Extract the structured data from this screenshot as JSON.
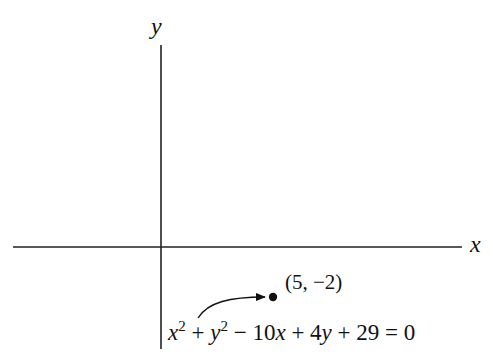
{
  "diagram": {
    "axes": {
      "x_label": "x",
      "y_label": "y",
      "origin_px": [
        161,
        247
      ]
    },
    "point": {
      "label": "(5, −2)",
      "coords": [
        5,
        -2
      ]
    },
    "equation": {
      "x_term": "x",
      "x_exp": "2",
      "plus1": " + ",
      "y_term": "y",
      "y_exp": "2",
      "rest_minus": " − 10",
      "rest_x": "x",
      "rest_plus": " + 4",
      "rest_y": "y",
      "rest_tail": " + 29 = 0",
      "full": "x² + y² − 10x + 4y + 29 = 0"
    },
    "annotation": {
      "arrow": "curved arrow from equation to point"
    },
    "colors": {
      "ink": "#111111",
      "background": "#ffffff"
    }
  }
}
